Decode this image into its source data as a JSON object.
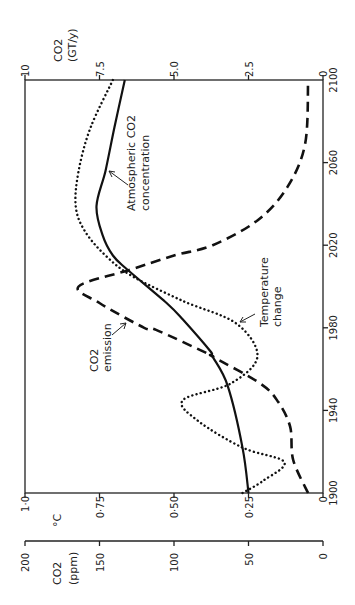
{
  "chart_data": {
    "type": "line",
    "orientation": "rotated 90 degrees counter-clockwise (time runs bottom-to-top along the right edge)",
    "title": "",
    "x": {
      "label": "Year",
      "ticks": [
        1900,
        1940,
        1980,
        2020,
        2060,
        2100
      ],
      "range": [
        1900,
        2100
      ]
    },
    "y_axes": [
      {
        "id": "emission",
        "label": "CO2 (GT/y)",
        "label_main": "CO2",
        "label_unit": "(GT/y)",
        "ticks": [
          "10",
          "7.5",
          "5.0",
          "2.5",
          "0"
        ],
        "range": [
          0,
          10
        ]
      },
      {
        "id": "temperature",
        "label": "°C",
        "ticks": [
          "1·0",
          "0·75",
          "0·50",
          "0·25",
          "0"
        ],
        "range": [
          0,
          1.0
        ]
      },
      {
        "id": "concentration",
        "label": "CO2 (ppm)",
        "label_main": "CO2",
        "label_unit": "(ppm)",
        "ticks": [
          "200",
          "150",
          "100",
          "50",
          "0"
        ],
        "range": [
          0,
          200
        ]
      }
    ],
    "series": [
      {
        "name": "CO2 emission",
        "axis": "emission",
        "style": "dashed",
        "points": [
          [
            1900,
            0.5
          ],
          [
            1916,
            1.0
          ],
          [
            1932,
            1.1
          ],
          [
            1944,
            1.5
          ],
          [
            1953,
            2.1
          ],
          [
            1966,
            3.7
          ],
          [
            1967,
            3.8
          ],
          [
            1979,
            5.6
          ],
          [
            1980,
            6.0
          ],
          [
            1992,
            7.5
          ],
          [
            2000,
            8.2
          ],
          [
            2008,
            6.5
          ],
          [
            2015,
            5.0
          ],
          [
            2020,
            3.7
          ],
          [
            2032,
            2.2
          ],
          [
            2048,
            1.2
          ],
          [
            2069,
            0.6
          ],
          [
            2100,
            0.5
          ]
        ]
      },
      {
        "name": "Atmospheric CO2 concentration",
        "axis": "concentration",
        "style": "solid",
        "points": [
          [
            1900,
            50
          ],
          [
            1922,
            54
          ],
          [
            1952,
            64
          ],
          [
            1966,
            74
          ],
          [
            1969,
            76
          ],
          [
            1984,
            94
          ],
          [
            1992,
            105
          ],
          [
            2008,
            131
          ],
          [
            2015,
            141
          ],
          [
            2025,
            148
          ],
          [
            2039,
            152
          ],
          [
            2056,
            146
          ],
          [
            2077,
            140
          ],
          [
            2100,
            133
          ]
        ]
      },
      {
        "name": "Temperature change",
        "axis": "temperature",
        "style": "dotted",
        "points": [
          [
            1900,
            0.27
          ],
          [
            1906,
            0.2
          ],
          [
            1915,
            0.13
          ],
          [
            1922,
            0.27
          ],
          [
            1935,
            0.42
          ],
          [
            1945,
            0.47
          ],
          [
            1953,
            0.31
          ],
          [
            1966,
            0.22
          ],
          [
            1982,
            0.29
          ],
          [
            1993,
            0.47
          ],
          [
            2005,
            0.64
          ],
          [
            2015,
            0.73
          ],
          [
            2027,
            0.8
          ],
          [
            2039,
            0.83
          ],
          [
            2056,
            0.82
          ],
          [
            2077,
            0.78
          ],
          [
            2100,
            0.705
          ]
        ]
      }
    ],
    "annotations": [
      {
        "text_line1": "CO2",
        "text_line2": "emission",
        "target_series": "CO2 emission"
      },
      {
        "text_line1": "Temperature",
        "text_line2": "change",
        "target_series": "Temperature change"
      },
      {
        "text_line1": "Atmospheric CO2",
        "text_line2": "concentration",
        "target_series": "Atmospheric CO2 concentration"
      }
    ],
    "grid": false,
    "legend": "none (inline annotations with arrows)"
  }
}
